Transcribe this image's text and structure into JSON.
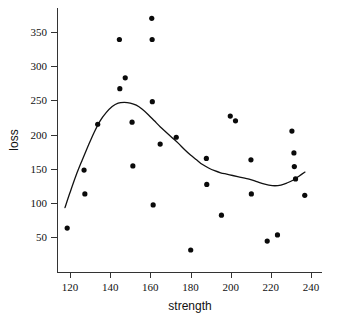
{
  "chart_data": {
    "type": "scatter",
    "title": "",
    "xlabel": "strength",
    "ylabel": "loss",
    "xlim": [
      114,
      241
    ],
    "ylim": [
      20,
      385
    ],
    "xticks": [
      120,
      140,
      160,
      180,
      200,
      220,
      240
    ],
    "xtick_labels": [
      "120",
      "140",
      "160",
      "180",
      "200",
      "220",
      "240"
    ],
    "yticks": [
      50,
      100,
      150,
      200,
      250,
      300,
      350
    ],
    "ytick_labels": [
      "50",
      "100",
      "150",
      "200",
      "250",
      "300",
      "350"
    ],
    "grid": false,
    "legend": null,
    "legend_position": "none",
    "points": [
      {
        "x": 118.6,
        "y": 63
      },
      {
        "x": 127.0,
        "y": 148
      },
      {
        "x": 127.4,
        "y": 113
      },
      {
        "x": 133.8,
        "y": 215
      },
      {
        "x": 144.6,
        "y": 339
      },
      {
        "x": 144.8,
        "y": 267
      },
      {
        "x": 147.5,
        "y": 283
      },
      {
        "x": 150.9,
        "y": 218
      },
      {
        "x": 151.3,
        "y": 154
      },
      {
        "x": 160.7,
        "y": 370
      },
      {
        "x": 160.9,
        "y": 339
      },
      {
        "x": 161.0,
        "y": 248
      },
      {
        "x": 161.4,
        "y": 97
      },
      {
        "x": 164.9,
        "y": 186
      },
      {
        "x": 172.9,
        "y": 196
      },
      {
        "x": 180.1,
        "y": 31
      },
      {
        "x": 187.9,
        "y": 165
      },
      {
        "x": 188.1,
        "y": 127
      },
      {
        "x": 195.4,
        "y": 82
      },
      {
        "x": 199.8,
        "y": 227
      },
      {
        "x": 202.4,
        "y": 220
      },
      {
        "x": 210.1,
        "y": 163
      },
      {
        "x": 210.3,
        "y": 113
      },
      {
        "x": 218.2,
        "y": 44
      },
      {
        "x": 223.3,
        "y": 53
      },
      {
        "x": 230.5,
        "y": 205
      },
      {
        "x": 231.5,
        "y": 173
      },
      {
        "x": 231.7,
        "y": 153
      },
      {
        "x": 232.3,
        "y": 135
      },
      {
        "x": 236.9,
        "y": 111
      }
    ],
    "smooth_fit": {
      "name": "loess-smoother",
      "x": [
        117.5,
        120,
        123,
        126,
        129,
        132,
        135,
        138,
        141,
        144,
        147,
        150,
        153,
        156,
        159,
        162,
        165,
        168,
        171,
        174,
        177,
        180,
        183,
        186,
        189,
        192,
        195,
        198,
        201,
        204,
        207,
        210,
        213,
        216,
        219,
        222,
        225,
        228,
        231,
        234,
        237
      ],
      "y": [
        93,
        115,
        140,
        162,
        183,
        203,
        220,
        232,
        241,
        246,
        247,
        246,
        243,
        237,
        229,
        220,
        211,
        203,
        195,
        187,
        178,
        170,
        163,
        156,
        151,
        147,
        144,
        142,
        140,
        138,
        136,
        134,
        131,
        128,
        126,
        125,
        126,
        129,
        133,
        139,
        145
      ]
    }
  },
  "axes": {
    "x_axis_name": "x-axis",
    "y_axis_name": "y-axis"
  }
}
